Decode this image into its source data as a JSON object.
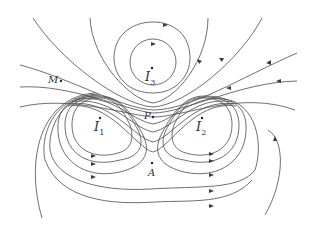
{
  "diagram": {
    "currents": [
      {
        "id": "I1",
        "symbol": "I",
        "subscript": "1"
      },
      {
        "id": "I2",
        "symbol": "I",
        "subscript": "2"
      },
      {
        "id": "I3",
        "symbol": "I",
        "subscript": "3"
      }
    ],
    "points": [
      {
        "id": "M",
        "label": "M"
      },
      {
        "id": "P",
        "label": "P"
      },
      {
        "id": "A",
        "label": "A"
      }
    ],
    "colors": {
      "line": "#4a4a4a",
      "background": "#ffffff"
    }
  }
}
